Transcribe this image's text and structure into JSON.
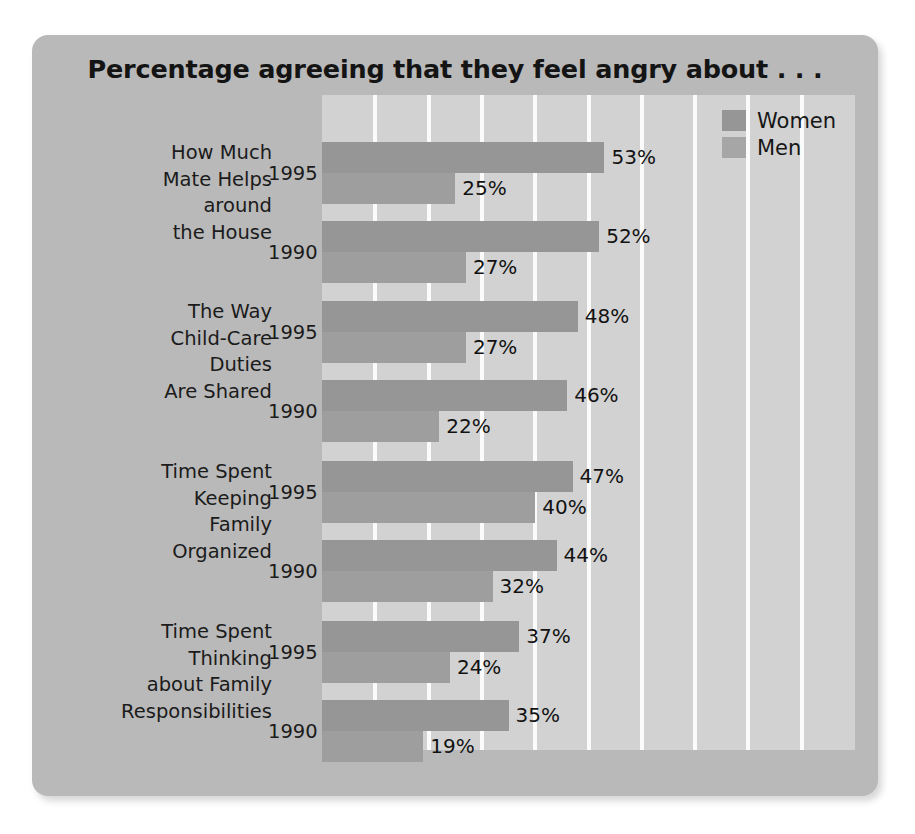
{
  "chart_data": {
    "type": "bar",
    "orientation": "horizontal",
    "title": "Percentage agreeing that they feel angry about . . .",
    "xlabel": "",
    "ylabel": "",
    "xlim": [
      0,
      100
    ],
    "grid": true,
    "grid_step": 10,
    "legend_position": "top-right",
    "legend": [
      "Women",
      "Men"
    ],
    "series": [
      {
        "name": "Women",
        "color": "#969696"
      },
      {
        "name": "Men",
        "color": "#9e9e9e"
      }
    ],
    "groups": [
      {
        "category": "How Much Mate Helps around the House",
        "category_lines": [
          "How Much",
          "Mate Helps",
          "around",
          "the House"
        ],
        "rows": [
          {
            "year": "1995",
            "women": 53,
            "men": 25,
            "women_label": "53%",
            "men_label": "25%"
          },
          {
            "year": "1990",
            "women": 52,
            "men": 27,
            "women_label": "52%",
            "men_label": "27%"
          }
        ]
      },
      {
        "category": "The Way Child-Care Duties Are Shared",
        "category_lines": [
          "The Way",
          "Child-Care",
          "Duties",
          "Are Shared"
        ],
        "rows": [
          {
            "year": "1995",
            "women": 48,
            "men": 27,
            "women_label": "48%",
            "men_label": "27%"
          },
          {
            "year": "1990",
            "women": 46,
            "men": 22,
            "women_label": "46%",
            "men_label": "22%"
          }
        ]
      },
      {
        "category": "Time Spent Keeping Family Organized",
        "category_lines": [
          "Time Spent",
          "Keeping",
          "Family",
          "Organized"
        ],
        "rows": [
          {
            "year": "1995",
            "women": 47,
            "men": 40,
            "women_label": "47%",
            "men_label": "40%"
          },
          {
            "year": "1990",
            "women": 44,
            "men": 32,
            "women_label": "44%",
            "men_label": "32%"
          }
        ]
      },
      {
        "category": "Time Spent Thinking about Family Responsibilities",
        "category_lines": [
          "Time Spent",
          "Thinking",
          "about Family",
          "Responsibilities"
        ],
        "rows": [
          {
            "year": "1995",
            "women": 37,
            "men": 24,
            "women_label": "37%",
            "men_label": "24%"
          },
          {
            "year": "1990",
            "women": 35,
            "men": 19,
            "women_label": "35%",
            "men_label": "19%"
          }
        ]
      }
    ]
  },
  "colors": {
    "card_background": "#b9b9b9",
    "plot_background": "#d2d2d2",
    "gridline": "#fbfbfb",
    "women_bar": "#969696",
    "men_bar": "#9e9e9e",
    "text": "#1b1b1b"
  }
}
